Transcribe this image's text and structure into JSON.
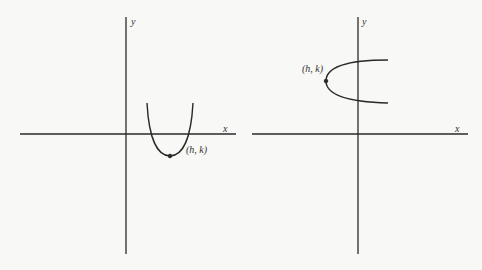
{
  "figures": [
    {
      "name": "vertical-parabola",
      "x_axis_label": "x",
      "y_axis_label": "y",
      "vertex_label": "(h, k)",
      "orientation": "opens-up"
    },
    {
      "name": "horizontal-parabola",
      "x_axis_label": "x",
      "y_axis_label": "y",
      "vertex_label": "(h, k)",
      "orientation": "opens-right"
    }
  ],
  "colors": {
    "ink": "#2a2a2a",
    "background": "#f8f8f6"
  }
}
